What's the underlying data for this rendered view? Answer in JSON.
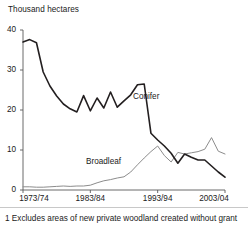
{
  "chart_data": {
    "type": "line",
    "title": "",
    "ylabel": "Thousand hectares",
    "xlabel": "",
    "ylim": [
      0,
      40
    ],
    "yticks": [
      0,
      10,
      20,
      30,
      40
    ],
    "ytick_labels": [
      "0",
      "10",
      "20",
      "30",
      "40"
    ],
    "xtick_labels": [
      "1973/74",
      "1983/84",
      "1993/94",
      "2003/04"
    ],
    "xtick_values": [
      1973,
      1983,
      1993,
      2003
    ],
    "xlim": [
      1973,
      2003
    ],
    "grid": false,
    "legend_position": "inline-annotation",
    "x": [
      "1973/74",
      "1974/75",
      "1975/76",
      "1976/77",
      "1977/78",
      "1978/79",
      "1979/80",
      "1980/81",
      "1981/82",
      "1982/83",
      "1983/84",
      "1984/85",
      "1985/86",
      "1986/87",
      "1987/88",
      "1988/89",
      "1989/90",
      "1990/91",
      "1991/92",
      "1992/93",
      "1993/94",
      "1994/95",
      "1995/96",
      "1996/97",
      "1997/98",
      "1998/99",
      "1999/00",
      "2000/01",
      "2001/02",
      "2002/03",
      "2003/04"
    ],
    "series": [
      {
        "name": "Conifer",
        "color": "#231f20",
        "values": [
          37.0,
          37.6,
          36.8,
          29.5,
          26.0,
          23.5,
          21.5,
          20.3,
          19.5,
          23.6,
          19.8,
          23.0,
          20.5,
          24.5,
          20.7,
          22.3,
          23.8,
          26.3,
          26.5,
          14.2,
          12.5,
          11.0,
          9.2,
          6.7,
          9.0,
          8.2,
          7.5,
          7.5,
          6.0,
          4.5,
          3.2
        ]
      },
      {
        "name": "Broadleaf",
        "color": "#8c8c8c",
        "values": [
          0.8,
          0.8,
          0.7,
          0.7,
          0.8,
          0.9,
          1.0,
          0.9,
          1.0,
          1.0,
          1.2,
          1.8,
          2.3,
          2.6,
          3.0,
          3.3,
          4.5,
          6.3,
          8.0,
          9.6,
          11.0,
          8.6,
          7.0,
          9.4,
          9.0,
          9.3,
          9.6,
          10.2,
          13.1,
          9.7,
          9.0
        ]
      }
    ],
    "annotations": [
      {
        "text": "Conifer",
        "x_px": 133,
        "y_px": 93
      },
      {
        "text": "Broadleaf",
        "x_px": 86,
        "y_px": 158
      }
    ]
  },
  "footnote": {
    "text": "1 Excludes areas of new private woodland created without grant"
  },
  "geometry": {
    "plot_left": 23,
    "plot_right": 225,
    "plot_top": 30,
    "plot_bottom": 190
  }
}
